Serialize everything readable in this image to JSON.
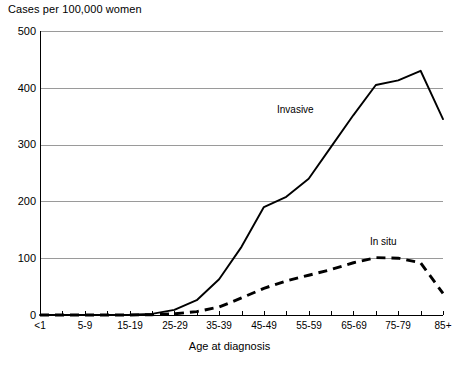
{
  "chart_data": {
    "type": "line",
    "title": "",
    "ylabel": "Cases per 100,000 women",
    "xlabel": "Age at diagnosis",
    "ylim": [
      0,
      500
    ],
    "yticks": [
      0,
      100,
      200,
      300,
      400,
      500
    ],
    "grid": true,
    "legend_position": "inline-annotations",
    "categories": [
      "<1",
      "1-4",
      "5-9",
      "10-14",
      "15-19",
      "20-24",
      "25-29",
      "30-34",
      "35-39",
      "40-44",
      "45-49",
      "50-54",
      "55-59",
      "60-64",
      "65-69",
      "70-74",
      "75-79",
      "80-84",
      "85+"
    ],
    "tick_labels_shown": [
      "<1",
      "5-9",
      "15-19",
      "25-29",
      "35-39",
      "45-49",
      "55-59",
      "65-69",
      "75-79",
      "85+"
    ],
    "series": [
      {
        "name": "Invasive",
        "style": "solid",
        "color": "#000000",
        "values": [
          0,
          0,
          0,
          0,
          0.5,
          2,
          9,
          26,
          63,
          120,
          190,
          208,
          240,
          296,
          352,
          405,
          413,
          430,
          345
        ]
      },
      {
        "name": "In situ",
        "style": "dashed",
        "color": "#000000",
        "values": [
          0,
          0,
          0,
          0,
          0,
          0.5,
          2,
          6,
          14,
          30,
          47,
          60,
          70,
          80,
          92,
          101,
          100,
          92,
          38
        ]
      }
    ]
  },
  "axes": {
    "y_title": "Cases per 100,000 women",
    "x_title": "Age at diagnosis",
    "y_tick_labels": [
      "500",
      "400",
      "300",
      "200",
      "100",
      "0"
    ],
    "x_tick_labels": [
      "<1",
      "5-9",
      "15-19",
      "25-29",
      "35-39",
      "45-49",
      "55-59",
      "65-69",
      "75-79",
      "85+"
    ]
  },
  "annotations": {
    "invasive_label": "Invasive",
    "insitu_label": "In situ"
  },
  "colors": {
    "line": "#000000",
    "grid": "#9a9a9a",
    "axis": "#000000",
    "background": "#ffffff"
  }
}
